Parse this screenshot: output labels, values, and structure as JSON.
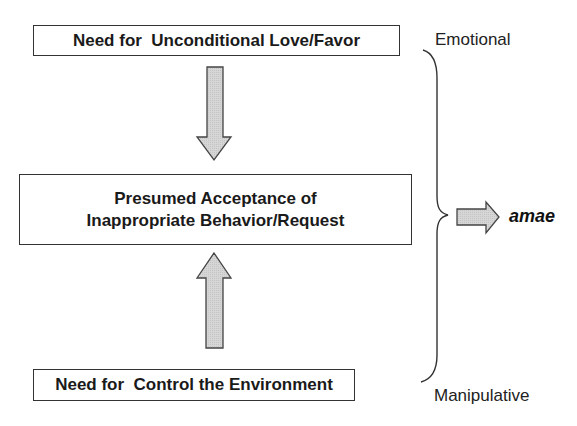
{
  "diagram": {
    "top_box": {
      "text": "Need for  Unconditional Love/Favor"
    },
    "middle_box": {
      "line1": "Presumed Acceptance of",
      "line2": "Inappropriate Behavior/Request"
    },
    "bottom_box": {
      "text": "Need for  Control the Environment"
    },
    "brace_labels": {
      "top": "Emotional",
      "bottom": "Manipulative"
    },
    "result": "amae",
    "arrows": [
      {
        "from": "top_box",
        "to": "middle_box",
        "direction": "down"
      },
      {
        "from": "bottom_box",
        "to": "middle_box",
        "direction": "up"
      },
      {
        "from": "brace",
        "to": "result",
        "direction": "right"
      }
    ],
    "colors": {
      "arrow_fill": "#d4d4d4",
      "stroke": "#333333",
      "text": "#1a1a1a"
    }
  }
}
